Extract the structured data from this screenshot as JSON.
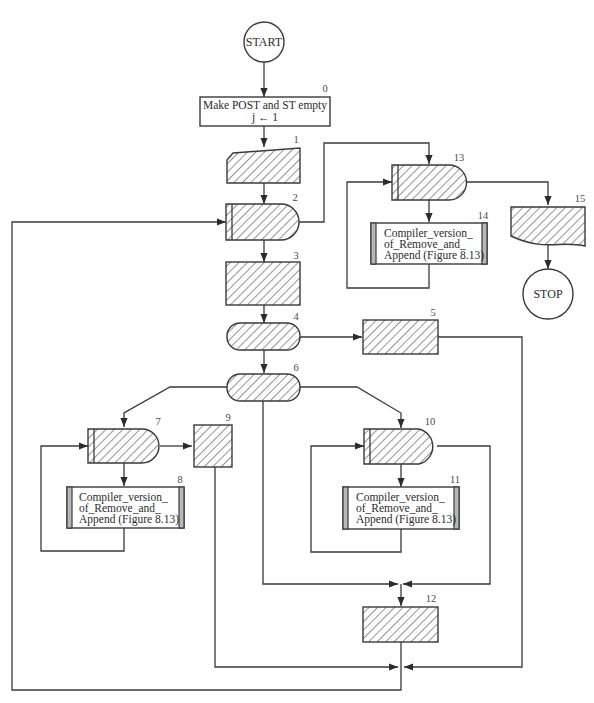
{
  "diagram": {
    "type": "flowchart",
    "style": {
      "line_color": "#3a3a3a",
      "hatch_color": "#3a3a3a",
      "bar_fill": "#b8b8b8",
      "background": "#ffffff"
    },
    "terminals": {
      "start": "START",
      "stop": "STOP"
    },
    "nodes": {
      "n0": {
        "number": "0",
        "shape": "process",
        "line1": "Make POST and ST empty",
        "line2": "j ← 1"
      },
      "n1": {
        "number": "1",
        "shape": "manual-input",
        "hatched": true
      },
      "n2": {
        "number": "2",
        "shape": "loop-decision",
        "hatched": true
      },
      "n3": {
        "number": "3",
        "shape": "process",
        "hatched": true
      },
      "n4": {
        "number": "4",
        "shape": "terminal-rounded",
        "hatched": true
      },
      "n5": {
        "number": "5",
        "shape": "process",
        "hatched": true
      },
      "n6": {
        "number": "6",
        "shape": "terminal-rounded",
        "hatched": true
      },
      "n7": {
        "number": "7",
        "shape": "loop-decision",
        "hatched": true
      },
      "n8": {
        "number": "8",
        "shape": "predefined-process",
        "line1": "Compiler_version_",
        "line2": "of_Remove_and_",
        "line3": "Append (Figure 8.13)"
      },
      "n9": {
        "number": "9",
        "shape": "process",
        "hatched": true
      },
      "n10": {
        "number": "10",
        "shape": "loop-decision",
        "hatched": true
      },
      "n11": {
        "number": "11",
        "shape": "predefined-process",
        "line1": "Compiler_version_",
        "line2": "of_Remove_and_",
        "line3": "Append (Figure 8.13)"
      },
      "n12": {
        "number": "12",
        "shape": "process",
        "hatched": true
      },
      "n13": {
        "number": "13",
        "shape": "loop-decision",
        "hatched": true
      },
      "n14": {
        "number": "14",
        "shape": "predefined-process",
        "line1": "Compiler_version_",
        "line2": "of_Remove_and_",
        "line3": "Append (Figure 8.13)"
      },
      "n15": {
        "number": "15",
        "shape": "document",
        "hatched": true
      }
    },
    "edges": [
      [
        "start",
        "n0"
      ],
      [
        "n0",
        "n1"
      ],
      [
        "n1",
        "n2"
      ],
      [
        "n2",
        "n3"
      ],
      [
        "n2",
        "n13"
      ],
      [
        "n13",
        "n14"
      ],
      [
        "n14",
        "n13"
      ],
      [
        "n13",
        "n15"
      ],
      [
        "n15",
        "stop"
      ],
      [
        "n3",
        "n4"
      ],
      [
        "n4",
        "n5"
      ],
      [
        "n4",
        "n6"
      ],
      [
        "n6",
        "n7"
      ],
      [
        "n6",
        "n10"
      ],
      [
        "n6",
        "n12"
      ],
      [
        "n7",
        "n8"
      ],
      [
        "n8",
        "n7"
      ],
      [
        "n7",
        "n9"
      ],
      [
        "n10",
        "n11"
      ],
      [
        "n11",
        "n10"
      ],
      [
        "n10",
        "n12"
      ],
      [
        "n9",
        "n2"
      ],
      [
        "n12",
        "n2"
      ],
      [
        "n5",
        "n2"
      ]
    ]
  }
}
